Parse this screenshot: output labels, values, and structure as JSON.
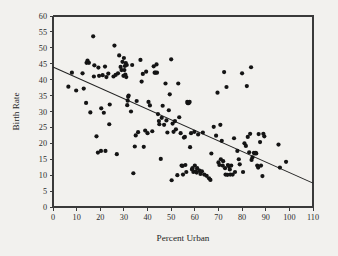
{
  "chart_data": {
    "type": "scatter",
    "title": "",
    "xlabel": "Percent Urban",
    "ylabel": "Birth Rate",
    "xlim": [
      0,
      110
    ],
    "ylim": [
      0,
      60
    ],
    "xticks": [
      0,
      10,
      20,
      30,
      40,
      50,
      60,
      70,
      80,
      90,
      100,
      110
    ],
    "yticks": [
      0,
      5,
      10,
      15,
      20,
      25,
      30,
      35,
      40,
      45,
      50,
      55,
      60
    ],
    "xtick_labels": [
      "0",
      "10",
      "20",
      "30",
      "40",
      "50",
      "60",
      "70",
      "80",
      "90",
      "100",
      "110"
    ],
    "ytick_labels": [
      "0",
      "5",
      "10",
      "15",
      "20",
      "25",
      "30",
      "35",
      "40",
      "45",
      "50",
      "55",
      "60"
    ],
    "grid": false,
    "legend": null,
    "marker_color": "#141414",
    "marker_size": 2.1,
    "line_color": "#222222",
    "background_color": "#f2f1ee",
    "axis_color": "#3a3a3a",
    "fit_line": {
      "name": "least-squares regression line",
      "x": [
        0,
        110
      ],
      "y": [
        44.0,
        7.5
      ],
      "intercept": 44.0,
      "slope": -0.332
    },
    "points": [
      [
        6.5,
        37.8
      ],
      [
        8.0,
        42.2
      ],
      [
        9.8,
        36.6
      ],
      [
        12.5,
        42.0
      ],
      [
        13.0,
        37.2
      ],
      [
        14.2,
        45.3
      ],
      [
        14.6,
        46.0
      ],
      [
        15.2,
        45.3
      ],
      [
        14.0,
        32.7
      ],
      [
        15.8,
        29.7
      ],
      [
        17.0,
        53.6
      ],
      [
        17.3,
        41.0
      ],
      [
        17.5,
        44.5
      ],
      [
        18.4,
        22.2
      ],
      [
        19.0,
        17.1
      ],
      [
        19.2,
        43.8
      ],
      [
        19.5,
        41.2
      ],
      [
        20.3,
        17.6
      ],
      [
        20.4,
        31.0
      ],
      [
        21.0,
        41.4
      ],
      [
        21.5,
        29.6
      ],
      [
        22.0,
        44.1
      ],
      [
        22.2,
        17.6
      ],
      [
        22.6,
        40.8
      ],
      [
        23.4,
        41.9
      ],
      [
        23.8,
        26.0
      ],
      [
        24.0,
        32.2
      ],
      [
        25.6,
        41.0
      ],
      [
        26.0,
        50.7
      ],
      [
        26.5,
        41.5
      ],
      [
        27.0,
        16.6
      ],
      [
        27.5,
        42.0
      ],
      [
        28.0,
        47.6
      ],
      [
        28.6,
        44.0
      ],
      [
        29.0,
        43.0
      ],
      [
        29.4,
        45.6
      ],
      [
        29.8,
        41.2
      ],
      [
        30.0,
        46.8
      ],
      [
        30.2,
        43.0
      ],
      [
        30.4,
        44.3
      ],
      [
        30.6,
        41.6
      ],
      [
        30.8,
        45.2
      ],
      [
        31.0,
        40.8
      ],
      [
        31.2,
        44.6
      ],
      [
        31.4,
        32.0
      ],
      [
        31.6,
        33.4
      ],
      [
        31.8,
        34.6
      ],
      [
        32.0,
        35.0
      ],
      [
        33.0,
        30.0
      ],
      [
        33.5,
        44.6
      ],
      [
        34.0,
        10.6
      ],
      [
        34.6,
        19.0
      ],
      [
        35.0,
        22.5
      ],
      [
        35.4,
        33.3
      ],
      [
        36.0,
        23.5
      ],
      [
        37.0,
        46.2
      ],
      [
        37.5,
        39.4
      ],
      [
        38.0,
        41.8
      ],
      [
        38.4,
        18.9
      ],
      [
        39.0,
        24.0
      ],
      [
        39.4,
        42.5
      ],
      [
        40.0,
        23.2
      ],
      [
        40.4,
        33.0
      ],
      [
        41.0,
        31.9
      ],
      [
        42.0,
        23.8
      ],
      [
        42.6,
        44.2
      ],
      [
        43.0,
        42.2
      ],
      [
        43.4,
        42.2
      ],
      [
        43.8,
        44.8
      ],
      [
        44.0,
        42.2
      ],
      [
        44.4,
        29.2
      ],
      [
        44.8,
        27.0
      ],
      [
        45.0,
        26.0
      ],
      [
        45.6,
        15.1
      ],
      [
        46.0,
        28.0
      ],
      [
        46.4,
        31.8
      ],
      [
        47.0,
        25.8
      ],
      [
        47.6,
        38.8
      ],
      [
        48.0,
        27.2
      ],
      [
        48.4,
        23.4
      ],
      [
        49.0,
        30.4
      ],
      [
        49.4,
        35.4
      ],
      [
        50.0,
        46.4
      ],
      [
        50.2,
        8.4
      ],
      [
        50.6,
        26.2
      ],
      [
        51.0,
        23.6
      ],
      [
        51.6,
        27.0
      ],
      [
        52.0,
        24.4
      ],
      [
        52.6,
        10.0
      ],
      [
        53.0,
        38.8
      ],
      [
        53.4,
        28.2
      ],
      [
        54.0,
        23.2
      ],
      [
        54.4,
        13.0
      ],
      [
        54.8,
        12.9
      ],
      [
        55.0,
        10.2
      ],
      [
        55.4,
        21.8
      ],
      [
        55.8,
        22.0
      ],
      [
        56.0,
        13.2
      ],
      [
        56.4,
        11.0
      ],
      [
        56.8,
        33.0
      ],
      [
        57.0,
        32.6
      ],
      [
        57.4,
        32.6
      ],
      [
        57.8,
        33.0
      ],
      [
        58.0,
        18.8
      ],
      [
        58.4,
        23.2
      ],
      [
        58.8,
        11.8
      ],
      [
        59.0,
        12.2
      ],
      [
        59.4,
        11.0
      ],
      [
        59.8,
        23.6
      ],
      [
        60.0,
        13.0
      ],
      [
        60.4,
        11.2
      ],
      [
        60.8,
        10.8
      ],
      [
        61.0,
        12.2
      ],
      [
        61.4,
        22.8
      ],
      [
        62.0,
        11.4
      ],
      [
        62.4,
        10.4
      ],
      [
        63.0,
        11.2
      ],
      [
        63.4,
        23.4
      ],
      [
        64.0,
        10.2
      ],
      [
        65.0,
        9.8
      ],
      [
        66.0,
        9.0
      ],
      [
        66.6,
        8.5
      ],
      [
        67.0,
        16.8
      ],
      [
        68.0,
        25.2
      ],
      [
        69.0,
        22.4
      ],
      [
        69.6,
        35.9
      ],
      [
        70.0,
        14.0
      ],
      [
        70.4,
        13.2
      ],
      [
        70.8,
        25.8
      ],
      [
        71.0,
        15.0
      ],
      [
        71.4,
        20.8
      ],
      [
        71.8,
        13.0
      ],
      [
        72.0,
        14.4
      ],
      [
        72.4,
        42.4
      ],
      [
        72.8,
        12.2
      ],
      [
        73.0,
        10.2
      ],
      [
        73.4,
        37.7
      ],
      [
        73.8,
        10.1
      ],
      [
        74.0,
        13.2
      ],
      [
        74.4,
        12.8
      ],
      [
        74.8,
        11.8
      ],
      [
        75.0,
        10.2
      ],
      [
        75.4,
        13.0
      ],
      [
        76.0,
        10.2
      ],
      [
        76.6,
        21.6
      ],
      [
        77.0,
        11.0
      ],
      [
        78.0,
        17.6
      ],
      [
        78.6,
        15.0
      ],
      [
        79.0,
        13.4
      ],
      [
        80.0,
        42.0
      ],
      [
        80.4,
        11.0
      ],
      [
        81.0,
        20.0
      ],
      [
        81.6,
        19.2
      ],
      [
        82.0,
        38.0
      ],
      [
        82.4,
        22.0
      ],
      [
        83.0,
        17.2
      ],
      [
        83.4,
        23.0
      ],
      [
        83.8,
        43.9
      ],
      [
        84.0,
        14.8
      ],
      [
        84.4,
        15.6
      ],
      [
        85.0,
        17.0
      ],
      [
        85.4,
        16.8
      ],
      [
        85.8,
        17.0
      ],
      [
        86.0,
        16.8
      ],
      [
        86.4,
        13.0
      ],
      [
        86.8,
        12.4
      ],
      [
        87.0,
        22.9
      ],
      [
        87.6,
        20.4
      ],
      [
        88.0,
        13.0
      ],
      [
        88.6,
        9.7
      ],
      [
        89.0,
        23.0
      ],
      [
        89.4,
        22.2
      ],
      [
        95.4,
        19.6
      ],
      [
        96.0,
        12.4
      ],
      [
        98.6,
        14.2
      ]
    ],
    "point_count": 176,
    "relationship": "negative linear association between percent urban and birth rate"
  }
}
